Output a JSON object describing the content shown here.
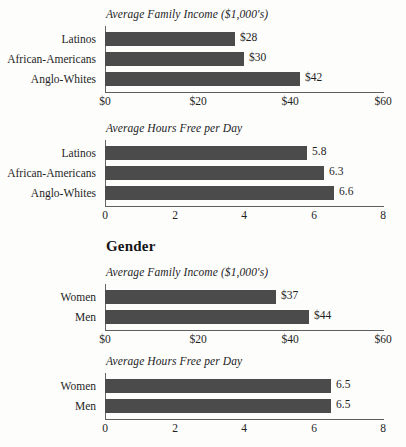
{
  "page": {
    "background_color": "#fdfdfc",
    "bar_color": "#4b4b4b",
    "axis_color": "#5e5e5e",
    "text_color": "#1f1f1f"
  },
  "section_heading": {
    "label": "Gender"
  },
  "charts": [
    {
      "id": "race-income",
      "title": "Average Family Income ($1,000's)",
      "categories": [
        "Latinos",
        "African-Americans",
        "Anglo-Whites"
      ],
      "values": [
        28,
        30,
        42
      ],
      "value_labels": [
        "$28",
        "$30",
        "$42"
      ],
      "ticks": [
        "$0",
        "$20",
        "$40",
        "$60"
      ],
      "tick_values": [
        0,
        20,
        40,
        60
      ],
      "xmin": 0,
      "xmax": 60
    },
    {
      "id": "race-hours",
      "title": "Average Hours Free per Day",
      "categories": [
        "Latinos",
        "African-Americans",
        "Anglo-Whites"
      ],
      "values": [
        5.8,
        6.3,
        6.6
      ],
      "value_labels": [
        "5.8",
        "6.3",
        "6.6"
      ],
      "ticks": [
        "0",
        "2",
        "4",
        "6",
        "8"
      ],
      "tick_values": [
        0,
        2,
        4,
        6,
        8
      ],
      "xmin": 0,
      "xmax": 8
    },
    {
      "id": "gender-income",
      "title": "Average Family Income ($1,000's)",
      "categories": [
        "Women",
        "Men"
      ],
      "values": [
        37,
        44
      ],
      "value_labels": [
        "$37",
        "$44"
      ],
      "ticks": [
        "$0",
        "$20",
        "$40",
        "$60"
      ],
      "tick_values": [
        0,
        20,
        40,
        60
      ],
      "xmin": 0,
      "xmax": 60
    },
    {
      "id": "gender-hours",
      "title": "Average Hours Free per Day",
      "categories": [
        "Women",
        "Men"
      ],
      "values": [
        6.5,
        6.5
      ],
      "value_labels": [
        "6.5",
        "6.5"
      ],
      "ticks": [
        "0",
        "2",
        "4",
        "6",
        "8"
      ],
      "tick_values": [
        0,
        2,
        4,
        6,
        8
      ],
      "xmin": 0,
      "xmax": 8
    }
  ],
  "chart_data": [
    {
      "type": "bar",
      "orientation": "horizontal",
      "title": "Average Family Income ($1,000's)",
      "categories": [
        "Latinos",
        "African-Americans",
        "Anglo-Whites"
      ],
      "values": [
        28,
        30,
        42
      ],
      "xlabel": "",
      "ylabel": "",
      "xlim": [
        0,
        60
      ],
      "xticks": [
        0,
        20,
        40,
        60
      ],
      "xticklabels": [
        "$0",
        "$20",
        "$40",
        "$60"
      ],
      "data_labels": [
        "$28",
        "$30",
        "$42"
      ],
      "grid": false,
      "legend": false,
      "group": "Race/Ethnicity"
    },
    {
      "type": "bar",
      "orientation": "horizontal",
      "title": "Average Hours Free per Day",
      "categories": [
        "Latinos",
        "African-Americans",
        "Anglo-Whites"
      ],
      "values": [
        5.8,
        6.3,
        6.6
      ],
      "xlabel": "",
      "ylabel": "",
      "xlim": [
        0,
        8
      ],
      "xticks": [
        0,
        2,
        4,
        6,
        8
      ],
      "xticklabels": [
        "0",
        "2",
        "4",
        "6",
        "8"
      ],
      "data_labels": [
        "5.8",
        "6.3",
        "6.6"
      ],
      "grid": false,
      "legend": false,
      "group": "Race/Ethnicity"
    },
    {
      "type": "bar",
      "orientation": "horizontal",
      "title": "Average Family Income ($1,000's)",
      "categories": [
        "Women",
        "Men"
      ],
      "values": [
        37,
        44
      ],
      "xlabel": "",
      "ylabel": "",
      "xlim": [
        0,
        60
      ],
      "xticks": [
        0,
        20,
        40,
        60
      ],
      "xticklabels": [
        "$0",
        "$20",
        "$40",
        "$60"
      ],
      "data_labels": [
        "$37",
        "$44"
      ],
      "grid": false,
      "legend": false,
      "group": "Gender"
    },
    {
      "type": "bar",
      "orientation": "horizontal",
      "title": "Average Hours Free per Day",
      "categories": [
        "Women",
        "Men"
      ],
      "values": [
        6.5,
        6.5
      ],
      "xlabel": "",
      "ylabel": "",
      "xlim": [
        0,
        8
      ],
      "xticks": [
        0,
        2,
        4,
        6,
        8
      ],
      "xticklabels": [
        "0",
        "2",
        "4",
        "6",
        "8"
      ],
      "data_labels": [
        "6.5",
        "6.5"
      ],
      "grid": false,
      "legend": false,
      "group": "Gender"
    }
  ]
}
